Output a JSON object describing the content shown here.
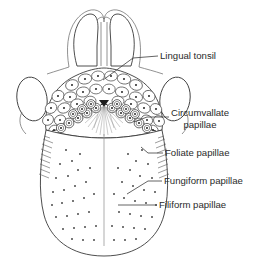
{
  "figure": {
    "type": "anatomical-diagram",
    "width": 258,
    "height": 268,
    "background_color": "#ffffff",
    "line_color": "#3a3a3a",
    "text_color": "#2b2b2b"
  },
  "labels": [
    {
      "id": "lingual-tonsil",
      "text": "Lingual tonsil",
      "lines": [
        "Lingual tonsil"
      ],
      "text_x": 160,
      "text_y": 56,
      "leader": "M 158 56 L 133 58 L 103 80"
    },
    {
      "id": "circumvallate-papillae",
      "text": "Circumvallate papillae",
      "lines": [
        "Circumvallate",
        "papillae"
      ],
      "text_x": 171,
      "text_y": 116,
      "leader": "M 169 117 L 147 117 L 134 122"
    },
    {
      "id": "foliate-papillae",
      "text": "Foliate papillae",
      "lines": [
        "Foliate papillae"
      ],
      "text_x": 165,
      "text_y": 153,
      "leader": "M 163 153 L 147 153 L 141 148"
    },
    {
      "id": "fungiform-papillae",
      "text": "Fungiform papillae",
      "lines": [
        "Fungiform papillae"
      ],
      "text_x": 164,
      "text_y": 181,
      "leader": "M 162 181 L 147 181 L 127 194"
    },
    {
      "id": "filiform-papillae",
      "text": "Filiform papillae",
      "lines": [
        "Filiform papillae"
      ],
      "text_x": 159,
      "text_y": 205,
      "leader": "M 157 205 L 118 205"
    }
  ],
  "structures": [
    {
      "id": "epiglottis",
      "name": "epiglottis-lobes",
      "description": "paired rounded lobes at top"
    },
    {
      "id": "palatine-tonsil-left",
      "name": "left-lateral-oval",
      "description": "oval structure left side"
    },
    {
      "id": "palatine-tonsil-right",
      "name": "right-lateral-oval",
      "description": "oval structure right side"
    },
    {
      "id": "lingual-tonsil-field",
      "name": "lingual-tonsil-nodules",
      "description": "cluster of rounded nodules with central pits"
    },
    {
      "id": "sulcus-terminalis",
      "name": "v-shaped-groove",
      "description": "V-shaped terminal sulcus with apex at foramen cecum"
    },
    {
      "id": "circumvallate-row",
      "name": "circumvallate-papillae-row",
      "description": "concentric-ring papillae along the V"
    },
    {
      "id": "median-sulcus",
      "name": "median-sulcus-line",
      "description": "vertical midline furrow"
    },
    {
      "id": "fungiform-field",
      "name": "fungiform-papillae-dots",
      "description": "scattered small dots over the tongue body"
    },
    {
      "id": "foliate-left",
      "name": "foliate-papillae-left",
      "description": "short parallel hatch lines on left margin"
    },
    {
      "id": "foliate-right",
      "name": "foliate-papillae-right",
      "description": "short parallel hatch lines on right margin"
    },
    {
      "id": "tongue-body",
      "name": "tongue-body-outline",
      "description": "U-shaped anterior tongue outline"
    }
  ]
}
